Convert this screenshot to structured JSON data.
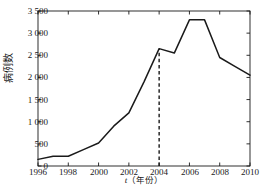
{
  "chart_data": {
    "type": "line",
    "title": "",
    "xlabel": "t（年份）",
    "xlabel_var": "t",
    "xlabel_unit": "（年份）",
    "ylabel": "病例数",
    "x": [
      1996,
      1997,
      1998,
      1999,
      2000,
      2001,
      2002,
      2003,
      2004,
      2005,
      2006,
      2007,
      2008,
      2009,
      2010
    ],
    "values": [
      150,
      220,
      220,
      370,
      520,
      900,
      1200,
      1900,
      2650,
      2550,
      3300,
      3300,
      2450,
      2250,
      2050
    ],
    "series": [
      {
        "name": "病例数",
        "values": [
          150,
          220,
          220,
          370,
          520,
          900,
          1200,
          1900,
          2650,
          2550,
          3300,
          3300,
          2450,
          2250,
          2050
        ]
      }
    ],
    "xlim": [
      1996,
      2010
    ],
    "ylim": [
      0,
      3500
    ],
    "ytick_values": [
      0,
      500,
      1000,
      1500,
      2000,
      2500,
      3000,
      3500
    ],
    "ytick_labels": [
      "0",
      "500",
      "1 000",
      "1 500",
      "2 000",
      "2 500",
      "3 000",
      "3 500"
    ],
    "xtick_values": [
      1996,
      1998,
      2000,
      2002,
      2004,
      2006,
      2008,
      2010
    ],
    "xtick_labels": [
      "1996",
      "1998",
      "2000",
      "2002",
      "2004",
      "2006",
      "2008",
      "2010"
    ],
    "grid": false,
    "legend": "none",
    "annotations": [
      {
        "type": "vertical-dashed-line",
        "x": 2004,
        "y_from": 0,
        "y_to": 2650,
        "label": ""
      }
    ],
    "line_color": "#1a1a1a",
    "axis_color": "#1a1a1a",
    "background_color": "#ffffff"
  }
}
